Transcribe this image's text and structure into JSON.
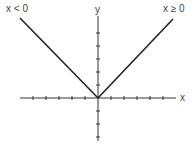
{
  "figure": {
    "labels": {
      "left_region": "x < 0",
      "right_region": "x ≥ 0",
      "x_axis": "x",
      "y_axis": "y"
    },
    "colors": {
      "line": "#222222",
      "axis": "#333333",
      "text": "#444444"
    },
    "axes": {
      "x_ticks_left": 5,
      "x_ticks_right": 5,
      "y_ticks_up": 5,
      "y_ticks_down": 3
    }
  }
}
